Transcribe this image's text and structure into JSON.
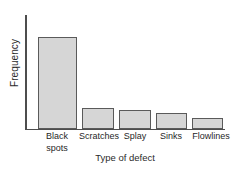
{
  "chart_data": {
    "type": "bar",
    "title": "",
    "subtitle": "",
    "xlabel": "Type of defect",
    "ylabel": "Frequency",
    "categories": [
      "Black\nspots",
      "Scratches",
      "Splay",
      "Sinks",
      "Flowlines"
    ],
    "category_names": [
      "Black spots",
      "Scratches",
      "Splay",
      "Sinks",
      "Flowlines"
    ],
    "values": [
      46,
      10,
      9,
      8,
      5
    ],
    "ylim": [
      0,
      57
    ],
    "xlim": [
      0,
      5
    ],
    "grid": false,
    "legend": false,
    "legend_position": "none",
    "tick_labels_y": [],
    "tick_labels_x": [
      "Black spots",
      "Scratches",
      "Splay",
      "Sinks",
      "Flowlines"
    ],
    "annotations": [],
    "colors": {
      "bar_fill": "#d6d6d6",
      "bar_border": "#5a5a5a",
      "axis": "#4d4d4d",
      "text": "#1f1f1f",
      "background": "#ffffff"
    },
    "bar_geometry": [
      {
        "left": 38,
        "width": 39,
        "top": 37
      },
      {
        "left": 82,
        "width": 32,
        "top": 108
      },
      {
        "left": 119,
        "width": 32,
        "top": 110
      },
      {
        "left": 156,
        "width": 31,
        "top": 113
      },
      {
        "left": 192,
        "width": 31,
        "top": 118
      }
    ],
    "label_geometry": [
      {
        "left": 28,
        "width": 58
      },
      {
        "left": 71,
        "width": 56
      },
      {
        "left": 111,
        "width": 48
      },
      {
        "left": 146,
        "width": 50
      },
      {
        "left": 182,
        "width": 58
      }
    ]
  }
}
